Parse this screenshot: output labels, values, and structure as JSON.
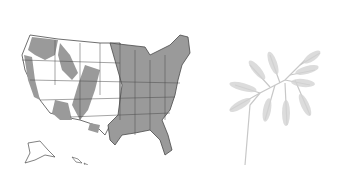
{
  "figure": {
    "panels": [
      {
        "name": "us-range-map",
        "description": "Map of the United States with shaded distribution range (gray) over state outlines, including Alaska and Hawaii insets"
      },
      {
        "name": "fern-illustration",
        "description": "Light gray drawing of a bracken fern frond on a long stalk"
      }
    ],
    "colors": {
      "range_fill": "#9a9a9a",
      "state_outline": "#4a4a4a",
      "background": "#ffffff",
      "fern": "#c8c8c8"
    }
  }
}
